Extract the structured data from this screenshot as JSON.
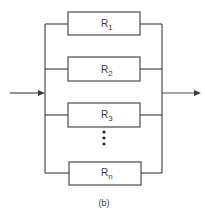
{
  "diagram": {
    "type": "parallel-resistor-network",
    "caption": "(b)",
    "resistors": [
      {
        "base": "R",
        "sub": "1"
      },
      {
        "base": "R",
        "sub": "2"
      },
      {
        "base": "R",
        "sub": "3"
      },
      {
        "base": "R",
        "sub": "n"
      }
    ],
    "ellipsis": "⋮",
    "input": "input-arrow",
    "output": "output-arrow",
    "colors": {
      "line": "#4a4a4a",
      "background": "#ffffff"
    }
  }
}
